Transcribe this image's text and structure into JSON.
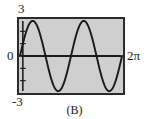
{
  "figure": {
    "caption": "(B)",
    "labels": {
      "y_max": "3",
      "y_zero": "0",
      "y_min": "-3",
      "x_max": "2π"
    }
  },
  "chart_data": {
    "type": "line",
    "title": "(B)",
    "xlabel": "",
    "ylabel": "",
    "function": "y = 3 sin(2x)",
    "amplitude": 3,
    "periods_shown": 2,
    "xlim": [
      0,
      6.283185307179586
    ],
    "ylim": [
      -3,
      3
    ],
    "x_tick_labels": [
      "2π"
    ],
    "y_tick_labels": [
      "3",
      "0",
      "-3"
    ],
    "grid": false,
    "legend": false,
    "background_color": "#cfcfcf",
    "line_color": "#1a1a1a",
    "frame_color": "#2b2b2b",
    "series": [
      {
        "name": "y = 3 sin(2x)",
        "x": [
          0,
          0.1963,
          0.3927,
          0.589,
          0.7854,
          0.9817,
          1.1781,
          1.3744,
          1.5708,
          1.7671,
          1.9635,
          2.1598,
          2.3562,
          2.5525,
          2.7489,
          2.9452,
          3.1416,
          3.3379,
          3.5343,
          3.7306,
          3.927,
          4.1233,
          4.3197,
          4.516,
          4.7124,
          4.9087,
          5.1051,
          5.3014,
          5.4978,
          5.6941,
          5.8905,
          6.0868,
          6.2832
        ],
        "y": [
          0,
          1.1481,
          2.1213,
          2.7716,
          3,
          2.7716,
          2.1213,
          1.1481,
          0,
          -1.1481,
          -2.1213,
          -2.7716,
          -3,
          -2.7716,
          -2.1213,
          -1.1481,
          0,
          1.1481,
          2.1213,
          2.7716,
          3,
          2.7716,
          2.1213,
          1.1481,
          0,
          -1.1481,
          -2.1213,
          -2.7716,
          -3,
          -2.7716,
          -2.1213,
          -1.1481,
          0
        ]
      }
    ]
  }
}
